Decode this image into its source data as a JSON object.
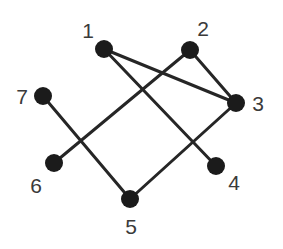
{
  "graph": {
    "edge_color": "#262626",
    "node_color": "#1b1b1b",
    "label_color": "#3a3a3a",
    "nodes": [
      {
        "id": "1",
        "label": "1",
        "x": 104,
        "y": 49,
        "lx": 88,
        "ly": 30
      },
      {
        "id": "2",
        "label": "2",
        "x": 190,
        "y": 50,
        "lx": 203,
        "ly": 28
      },
      {
        "id": "3",
        "label": "3",
        "x": 236,
        "y": 103,
        "lx": 258,
        "ly": 103
      },
      {
        "id": "4",
        "label": "4",
        "x": 216,
        "y": 166,
        "lx": 234,
        "ly": 182
      },
      {
        "id": "5",
        "label": "5",
        "x": 130,
        "y": 199,
        "lx": 131,
        "ly": 226
      },
      {
        "id": "6",
        "label": "6",
        "x": 54,
        "y": 163,
        "lx": 36,
        "ly": 185
      },
      {
        "id": "7",
        "label": "7",
        "x": 43,
        "y": 96,
        "lx": 22,
        "ly": 96
      }
    ],
    "edges": [
      {
        "from": "1",
        "to": "3"
      },
      {
        "from": "1",
        "to": "4"
      },
      {
        "from": "2",
        "to": "3"
      },
      {
        "from": "2",
        "to": "6"
      },
      {
        "from": "3",
        "to": "5"
      },
      {
        "from": "7",
        "to": "5"
      }
    ]
  }
}
